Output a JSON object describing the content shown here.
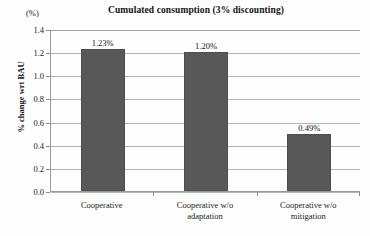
{
  "chart_data": {
    "type": "bar",
    "title": "Cumulated consumption (3% discounting)",
    "unit_label": "(%)",
    "xlabel": "",
    "ylabel": "% change wrt BAU",
    "ylim": [
      0.0,
      1.4
    ],
    "ytick_labels": [
      "1.4",
      "1.2",
      "1.0",
      "0.8",
      "0.6",
      "0.4",
      "0.2",
      "0.0"
    ],
    "ytick_values": [
      1.4,
      1.2,
      1.0,
      0.8,
      0.6,
      0.4,
      0.2,
      0.0
    ],
    "grid": true,
    "legend": "none",
    "categories": [
      "Cooperative",
      "Cooperative w/o adaptation",
      "Cooperative w/o mitigation"
    ],
    "category_lines": [
      [
        "Cooperative"
      ],
      [
        "Cooperative w/o",
        "adaptation"
      ],
      [
        "Cooperative w/o",
        "mitigation"
      ]
    ],
    "values": [
      1.23,
      1.2,
      0.49
    ],
    "data_labels": [
      "1.23%",
      "1.20%",
      "0.49%"
    ],
    "bar_color": "#585859"
  }
}
